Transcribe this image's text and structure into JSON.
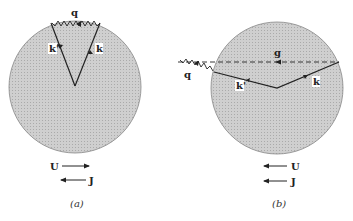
{
  "panels": [
    {
      "caption": "(a)",
      "labels": {
        "q": "q",
        "k_prime": "k'",
        "k": "k"
      },
      "legend": [
        {
          "label": "U",
          "direction": "right"
        },
        {
          "label": "J",
          "direction": "left"
        }
      ]
    },
    {
      "caption": "(b)",
      "labels": {
        "g": "g",
        "q": "q",
        "k_prime": "k'",
        "k": "k"
      },
      "legend": [
        {
          "label": "U",
          "direction": "left"
        },
        {
          "label": "J",
          "direction": "left"
        }
      ]
    }
  ],
  "colors": {
    "fill": "#c4c4c4",
    "line": "#222222"
  }
}
